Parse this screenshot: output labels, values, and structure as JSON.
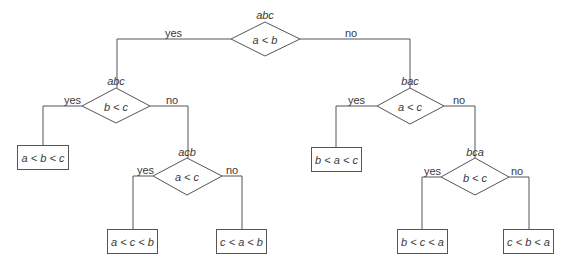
{
  "diagram": {
    "type": "decision-tree",
    "colors": {
      "line": "#555555",
      "text": "#3a3a3a",
      "background": "#ffffff"
    },
    "nodes": {
      "root": {
        "perm": "abc",
        "test": "a < b"
      },
      "left": {
        "perm": "abc",
        "test": "b < c"
      },
      "left_no": {
        "perm": "acb",
        "test": "a < c"
      },
      "right": {
        "perm": "bac",
        "test": "a < c"
      },
      "right_no": {
        "perm": "bca",
        "test": "b < c"
      }
    },
    "leaves": {
      "l1": "a < b < c",
      "l2": "a < c < b",
      "l3": "c < a < b",
      "r1": "b < a < c",
      "r2": "b < c < a",
      "r3": "c < b < a"
    },
    "branches": {
      "root_yes": "yes",
      "root_no": "no",
      "left_yes": "yes",
      "left_no": "no",
      "left_no_yes": "yes",
      "left_no_no": "no",
      "right_yes": "yes",
      "right_no": "no",
      "right_no_yes": "yes",
      "right_no_no": "no"
    }
  }
}
